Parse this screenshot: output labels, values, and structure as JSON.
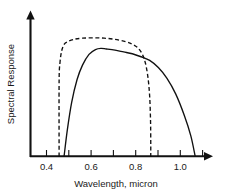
{
  "chart_data": {
    "type": "line",
    "title": "",
    "xlabel": "Wavelength, micron",
    "ylabel": "Spectral Response",
    "xlim": [
      0.33,
      1.14
    ],
    "ylim": [
      0,
      1.12
    ],
    "grid": false,
    "legend": null,
    "xticks": [
      0.4,
      0.5,
      0.6,
      0.7,
      0.8,
      0.9,
      1.0,
      1.1
    ],
    "xtick_labels": [
      "0.4",
      "",
      "0.6",
      "",
      "0.8",
      "",
      "1.0",
      ""
    ],
    "yticks": [],
    "ytick_labels": [],
    "series": [
      {
        "name": "solid-response-curve",
        "style": "solid",
        "color": "#111111",
        "x": [
          0.485,
          0.5,
          0.52,
          0.545,
          0.57,
          0.6,
          0.63,
          0.655,
          0.68,
          0.72,
          0.76,
          0.8,
          0.84,
          0.88,
          0.92,
          0.96,
          1.0,
          1.04,
          1.07,
          1.09
        ],
        "y": [
          0.0,
          0.22,
          0.45,
          0.64,
          0.76,
          0.85,
          0.89,
          0.9,
          0.895,
          0.885,
          0.87,
          0.855,
          0.83,
          0.8,
          0.74,
          0.65,
          0.52,
          0.34,
          0.17,
          0.0
        ]
      },
      {
        "name": "dashed-response-curve",
        "style": "dashed",
        "color": "#111111",
        "x": [
          0.462,
          0.462,
          0.466,
          0.474,
          0.486,
          0.5,
          0.53,
          0.57,
          0.62,
          0.67,
          0.72,
          0.77,
          0.8,
          0.825,
          0.845,
          0.86,
          0.872,
          0.88,
          0.884,
          0.885,
          0.885
        ],
        "y": [
          0.0,
          0.62,
          0.78,
          0.88,
          0.935,
          0.955,
          0.975,
          0.985,
          0.988,
          0.985,
          0.975,
          0.955,
          0.935,
          0.905,
          0.855,
          0.78,
          0.66,
          0.5,
          0.3,
          0.12,
          0.0
        ]
      }
    ],
    "annotations": []
  },
  "axis": {
    "x_arrow": "arrow-right",
    "y_arrow": "arrow-up"
  }
}
